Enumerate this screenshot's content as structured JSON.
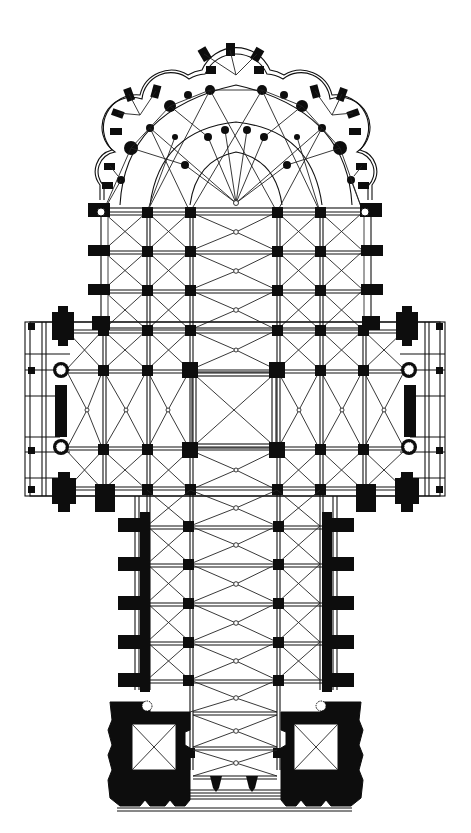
{
  "diagram": {
    "type": "architectural-floor-plan",
    "colors": {
      "ink": "#0d0d0d",
      "paper": "#ffffff"
    },
    "parts": {
      "chevet": {
        "label": "Chevet with radiating chapels",
        "chapels": 5
      },
      "choir": {
        "label": "Choir",
        "bays": 4
      },
      "transept": {
        "label": "Transept",
        "arms": 2
      },
      "crossing": {
        "label": "Crossing"
      },
      "nave": {
        "label": "Nave with double aisles",
        "bays": 6
      },
      "west_front": {
        "label": "West front with twin towers",
        "towers": 2
      }
    },
    "grid": {
      "aisle_x": [
        103,
        147,
        190,
        277,
        320,
        363
      ],
      "choir_rows": [
        212,
        251,
        290,
        330
      ],
      "transept_rows": [
        370,
        410,
        450,
        490
      ],
      "nave_rows": [
        490,
        526,
        564,
        603,
        642,
        680
      ]
    }
  }
}
